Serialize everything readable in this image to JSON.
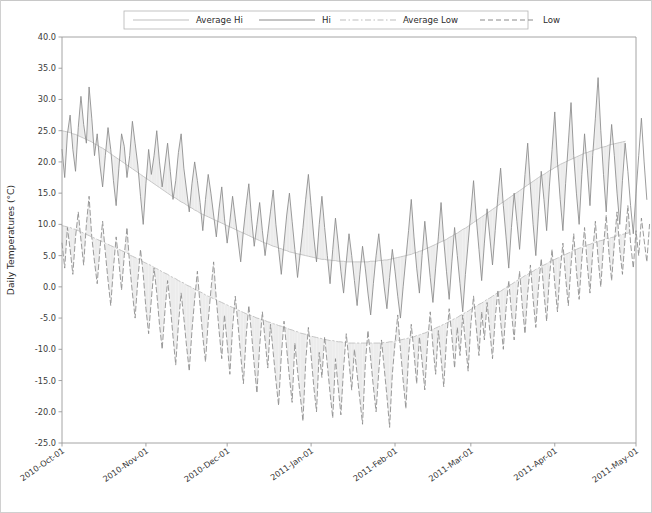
{
  "figure": {
    "width": 652,
    "height": 513,
    "background": "#ffffff",
    "border_color": "#d0d0d0"
  },
  "legend": {
    "position": "top-center",
    "entries": [
      {
        "label": "Average Hi",
        "color": "#bfbfbf",
        "style": "solid",
        "name": "legend-average-hi"
      },
      {
        "label": "Hi",
        "color": "#8a8a8a",
        "style": "solid",
        "name": "legend-hi"
      },
      {
        "label": "Average Low",
        "color": "#bdbdbd",
        "style": "dashdot",
        "name": "legend-average-low"
      },
      {
        "label": "Low",
        "color": "#8a8a8a",
        "style": "dashed",
        "name": "legend-low"
      }
    ]
  },
  "chart_data": {
    "type": "line",
    "title": "",
    "xlabel": "",
    "ylabel": "Daily Temperatures (°C)",
    "ylim": [
      -25.0,
      40.0
    ],
    "yticks": [
      40.0,
      35.0,
      30.0,
      25.0,
      20.0,
      15.0,
      10.0,
      5.0,
      0.0,
      -5.0,
      -10.0,
      -15.0,
      -20.0,
      -25.0
    ],
    "ytick_labels": [
      "40.0",
      "35.0",
      "30.0",
      "25.0",
      "20.0",
      "15.0",
      "10.0",
      "5.0",
      "0.0",
      "-5.0",
      "-10.0",
      "-15.0",
      "-20.0",
      "-25.0"
    ],
    "xtick_labels": [
      "2010-Oct-01",
      "2010-Nov-01",
      "2010-Dec-01",
      "2011-Jan-01",
      "2011-Feb-01",
      "2011-Mar-01",
      "2011-Apr-01",
      "2011-May-01"
    ],
    "xtick_indices": [
      0,
      31,
      61,
      92,
      123,
      151,
      182,
      212
    ],
    "x_count": 213,
    "x_start": "2010-Oct-01",
    "x_end": "2011-May-01",
    "grid": false,
    "legend_position": "top-center",
    "fill_between": true,
    "fill_color": "#ececec",
    "series": [
      {
        "name": "Average Hi",
        "color": "#bfbfbf",
        "style": "solid",
        "values": [
          25.0,
          24.9,
          24.8,
          24.7,
          24.5,
          24.4,
          24.2,
          24.0,
          23.8,
          23.6,
          23.4,
          23.2,
          22.9,
          22.7,
          22.4,
          22.2,
          21.9,
          21.6,
          21.3,
          21.0,
          20.7,
          20.4,
          20.1,
          19.8,
          19.5,
          19.2,
          18.9,
          18.6,
          18.3,
          18.0,
          17.7,
          17.4,
          17.1,
          16.8,
          16.5,
          16.2,
          15.9,
          15.6,
          15.3,
          15.0,
          14.7,
          14.4,
          14.2,
          13.9,
          13.6,
          13.4,
          13.1,
          12.8,
          12.6,
          12.3,
          12.1,
          11.8,
          11.6,
          11.4,
          11.2,
          11.0,
          10.8,
          10.6,
          10.4,
          10.2,
          10.0,
          9.8,
          9.6,
          9.4,
          9.2,
          9.0,
          8.8,
          8.6,
          8.4,
          8.2,
          8.0,
          7.8,
          7.6,
          7.4,
          7.2,
          7.0,
          6.9,
          6.7,
          6.5,
          6.4,
          6.2,
          6.1,
          5.9,
          5.8,
          5.6,
          5.5,
          5.4,
          5.3,
          5.2,
          5.1,
          5.0,
          4.9,
          4.8,
          4.7,
          4.6,
          4.5,
          4.4,
          4.4,
          4.3,
          4.3,
          4.2,
          4.2,
          4.1,
          4.1,
          4.1,
          4.0,
          4.0,
          4.0,
          4.0,
          4.0,
          4.0,
          4.0,
          4.0,
          4.0,
          4.1,
          4.1,
          4.1,
          4.2,
          4.2,
          4.3,
          4.3,
          4.4,
          4.5,
          4.6,
          4.7,
          4.8,
          4.9,
          5.0,
          5.1,
          5.2,
          5.4,
          5.5,
          5.7,
          5.8,
          6.0,
          6.2,
          6.4,
          6.6,
          6.8,
          7.0,
          7.2,
          7.4,
          7.6,
          7.9,
          8.1,
          8.4,
          8.6,
          8.9,
          9.2,
          9.4,
          9.7,
          10.0,
          10.3,
          10.6,
          10.9,
          11.2,
          11.5,
          11.8,
          12.1,
          12.4,
          12.7,
          13.0,
          13.3,
          13.6,
          13.9,
          14.2,
          14.5,
          14.8,
          15.1,
          15.4,
          15.7,
          16.0,
          16.3,
          16.6,
          16.9,
          17.2,
          17.5,
          17.8,
          18.0,
          18.3,
          18.6,
          18.8,
          19.1,
          19.3,
          19.6,
          19.8,
          20.0,
          20.2,
          20.4,
          20.6,
          20.8,
          21.0,
          21.2,
          21.4,
          21.5,
          21.7,
          21.8,
          22.0,
          22.1,
          22.3,
          22.4,
          22.5,
          22.7,
          22.8,
          22.9,
          23.0,
          23.1,
          23.2,
          23.3
        ],
        "min": 4.0,
        "max": 25.0
      },
      {
        "name": "Hi",
        "color": "#8a8a8a",
        "style": "solid",
        "values": [
          22.0,
          17.5,
          24.5,
          27.5,
          22.0,
          18.5,
          25.5,
          30.5,
          26.0,
          23.0,
          32.0,
          27.0,
          21.0,
          24.5,
          19.5,
          16.0,
          21.0,
          25.5,
          22.0,
          17.0,
          13.0,
          19.0,
          24.5,
          22.5,
          17.5,
          21.0,
          26.5,
          23.0,
          19.5,
          14.5,
          10.0,
          16.5,
          22.0,
          18.0,
          21.0,
          25.0,
          20.0,
          16.0,
          19.5,
          23.0,
          18.5,
          14.0,
          17.0,
          21.5,
          24.5,
          19.0,
          15.5,
          12.0,
          16.5,
          20.0,
          17.0,
          13.5,
          9.0,
          14.0,
          18.0,
          15.0,
          11.5,
          8.0,
          12.5,
          16.0,
          11.0,
          7.0,
          10.5,
          14.5,
          11.0,
          7.5,
          4.0,
          9.0,
          13.0,
          16.5,
          11.0,
          6.5,
          10.0,
          13.5,
          9.0,
          5.0,
          8.5,
          12.0,
          15.5,
          10.0,
          6.0,
          2.0,
          7.0,
          11.5,
          15.0,
          10.5,
          6.0,
          1.5,
          5.5,
          9.5,
          14.0,
          18.0,
          13.0,
          8.0,
          4.0,
          10.0,
          14.5,
          9.5,
          5.0,
          0.5,
          6.0,
          11.0,
          7.0,
          2.5,
          -1.0,
          4.0,
          8.5,
          5.0,
          1.0,
          -3.0,
          2.0,
          6.5,
          3.0,
          -1.0,
          -4.5,
          0.5,
          5.0,
          8.5,
          4.0,
          0.0,
          -3.5,
          1.5,
          6.0,
          2.5,
          -1.5,
          -5.0,
          0.0,
          4.5,
          9.0,
          14.0,
          8.0,
          3.0,
          -1.0,
          5.0,
          10.5,
          6.0,
          1.5,
          -2.5,
          3.0,
          8.0,
          13.5,
          7.5,
          2.5,
          -2.0,
          4.0,
          9.5,
          5.0,
          0.5,
          -4.0,
          2.0,
          7.0,
          12.0,
          17.0,
          11.0,
          6.0,
          1.0,
          7.0,
          12.5,
          8.0,
          3.5,
          9.0,
          14.5,
          19.0,
          13.0,
          8.0,
          3.0,
          9.5,
          15.0,
          10.5,
          6.0,
          12.0,
          18.0,
          23.0,
          16.0,
          10.0,
          5.0,
          12.0,
          18.5,
          14.0,
          9.0,
          16.0,
          22.0,
          28.0,
          20.0,
          14.0,
          9.0,
          16.5,
          23.0,
          29.5,
          21.0,
          15.0,
          10.0,
          18.0,
          24.5,
          19.0,
          13.0,
          21.0,
          27.0,
          33.5,
          25.0,
          18.0,
          12.0,
          20.0,
          26.0,
          21.0,
          15.0,
          10.0,
          17.0,
          23.0,
          18.5,
          13.0,
          8.5,
          15.0,
          21.0,
          27.0,
          20.0,
          14.0
        ],
        "min": -5.0,
        "max": 33.5
      },
      {
        "name": "Average Low",
        "color": "#bdbdbd",
        "style": "dashdot",
        "values": [
          9.8,
          9.7,
          9.6,
          9.5,
          9.3,
          9.2,
          9.0,
          8.8,
          8.6,
          8.4,
          8.2,
          8.0,
          7.8,
          7.6,
          7.4,
          7.2,
          7.0,
          6.8,
          6.6,
          6.4,
          6.2,
          6.0,
          5.8,
          5.6,
          5.4,
          5.1,
          4.9,
          4.7,
          4.5,
          4.3,
          4.0,
          3.8,
          3.6,
          3.4,
          3.1,
          2.9,
          2.7,
          2.4,
          2.2,
          2.0,
          1.7,
          1.5,
          1.3,
          1.0,
          0.8,
          0.6,
          0.3,
          0.1,
          -0.1,
          -0.4,
          -0.6,
          -0.8,
          -1.0,
          -1.3,
          -1.5,
          -1.7,
          -1.9,
          -2.1,
          -2.3,
          -2.5,
          -2.7,
          -2.9,
          -3.1,
          -3.3,
          -3.5,
          -3.7,
          -3.9,
          -4.1,
          -4.3,
          -4.5,
          -4.6,
          -4.8,
          -5.0,
          -5.1,
          -5.3,
          -5.4,
          -5.6,
          -5.7,
          -5.9,
          -6.0,
          -6.2,
          -6.3,
          -6.5,
          -6.6,
          -6.8,
          -6.9,
          -7.1,
          -7.2,
          -7.4,
          -7.5,
          -7.6,
          -7.8,
          -7.9,
          -8.0,
          -8.1,
          -8.2,
          -8.3,
          -8.4,
          -8.5,
          -8.6,
          -8.6,
          -8.7,
          -8.8,
          -8.8,
          -8.9,
          -8.9,
          -9.0,
          -9.0,
          -9.0,
          -9.0,
          -9.0,
          -9.0,
          -9.0,
          -9.0,
          -9.0,
          -9.0,
          -9.0,
          -9.0,
          -9.0,
          -8.9,
          -8.9,
          -8.8,
          -8.8,
          -8.7,
          -8.6,
          -8.5,
          -8.4,
          -8.3,
          -8.2,
          -8.1,
          -8.0,
          -7.8,
          -7.7,
          -7.5,
          -7.4,
          -7.2,
          -7.0,
          -6.8,
          -6.6,
          -6.4,
          -6.2,
          -6.0,
          -5.8,
          -5.6,
          -5.3,
          -5.1,
          -4.9,
          -4.6,
          -4.4,
          -4.1,
          -3.9,
          -3.6,
          -3.4,
          -3.1,
          -2.8,
          -2.6,
          -2.3,
          -2.0,
          -1.8,
          -1.5,
          -1.2,
          -0.9,
          -0.7,
          -0.4,
          -0.1,
          0.2,
          0.4,
          0.7,
          1.0,
          1.2,
          1.5,
          1.8,
          2.0,
          2.3,
          2.5,
          2.8,
          3.0,
          3.3,
          3.5,
          3.7,
          4.0,
          4.2,
          4.4,
          4.6,
          4.8,
          5.0,
          5.2,
          5.4,
          5.6,
          5.8,
          6.0,
          6.2,
          6.3,
          6.5,
          6.7,
          6.8,
          7.0,
          7.1,
          7.3,
          7.4,
          7.5,
          7.7,
          7.8,
          7.9,
          8.0,
          8.2,
          8.3,
          8.4,
          8.5,
          8.6,
          8.7
        ],
        "min": -9.0,
        "max": 9.8
      },
      {
        "name": "Low",
        "color": "#8a8a8a",
        "style": "dashed",
        "values": [
          7.0,
          3.0,
          9.5,
          6.0,
          2.0,
          8.0,
          12.0,
          7.5,
          3.5,
          10.0,
          14.5,
          8.0,
          4.0,
          0.5,
          6.0,
          10.5,
          5.5,
          1.0,
          -3.0,
          3.0,
          8.0,
          4.0,
          -0.5,
          5.0,
          9.5,
          3.5,
          -1.0,
          -5.0,
          1.0,
          6.0,
          2.0,
          -3.5,
          -7.5,
          -2.0,
          3.0,
          -1.0,
          -6.0,
          -10.0,
          -4.0,
          1.0,
          -3.0,
          -8.0,
          -12.5,
          -6.0,
          -1.0,
          -5.0,
          -9.5,
          -13.5,
          -7.0,
          -2.0,
          2.5,
          -3.0,
          -8.0,
          -12.0,
          -5.5,
          -0.5,
          4.0,
          -2.0,
          -7.0,
          -11.5,
          -4.5,
          -9.0,
          -14.0,
          -6.5,
          -1.5,
          -6.0,
          -11.0,
          -15.5,
          -8.0,
          -3.0,
          -7.5,
          -12.5,
          -17.0,
          -9.5,
          -4.0,
          -8.5,
          -13.0,
          -6.0,
          -10.5,
          -15.0,
          -19.0,
          -11.0,
          -5.5,
          -10.0,
          -14.5,
          -18.5,
          -9.0,
          -13.5,
          -17.5,
          -21.5,
          -12.0,
          -6.5,
          -11.0,
          -16.0,
          -20.0,
          -10.5,
          -14.5,
          -8.0,
          -12.5,
          -17.0,
          -21.0,
          -11.5,
          -16.0,
          -20.5,
          -13.0,
          -7.5,
          -12.0,
          -16.5,
          -10.0,
          -14.0,
          -18.0,
          -22.0,
          -12.5,
          -7.0,
          -11.5,
          -16.0,
          -20.0,
          -13.5,
          -8.5,
          -13.0,
          -17.5,
          -22.5,
          -14.0,
          -9.0,
          -4.5,
          -10.0,
          -15.0,
          -19.5,
          -11.0,
          -6.0,
          -10.5,
          -15.5,
          -8.0,
          -12.0,
          -16.5,
          -9.0,
          -4.0,
          -9.5,
          -14.0,
          -7.0,
          -11.5,
          -16.0,
          -8.5,
          -3.5,
          -8.0,
          -13.0,
          -6.5,
          -11.0,
          -4.5,
          -9.0,
          -13.5,
          -6.0,
          -1.5,
          -6.5,
          -11.0,
          -4.0,
          -8.5,
          -2.5,
          -7.0,
          -11.5,
          -5.0,
          -0.5,
          -5.5,
          -10.0,
          -3.5,
          1.0,
          -4.0,
          -8.5,
          -2.0,
          2.5,
          -3.0,
          -7.5,
          -1.0,
          3.5,
          -2.0,
          -6.5,
          0.0,
          4.5,
          -1.0,
          -5.5,
          1.5,
          6.0,
          0.5,
          -4.0,
          2.5,
          7.0,
          1.5,
          -3.0,
          3.5,
          8.5,
          2.5,
          -2.0,
          4.5,
          9.5,
          3.5,
          -1.0,
          5.5,
          10.5,
          4.5,
          0.0,
          6.5,
          11.5,
          5.5,
          1.0,
          7.0,
          12.0,
          6.0,
          2.0,
          8.0,
          13.0,
          7.0,
          3.0,
          9.0,
          5.0,
          11.0,
          7.5,
          4.0,
          10.0
        ],
        "min": -22.5,
        "max": 14.5
      }
    ]
  },
  "axes": {
    "left": 62,
    "top": 37,
    "right": 636,
    "bottom": 443,
    "spine_color": "#9a9a9a"
  }
}
